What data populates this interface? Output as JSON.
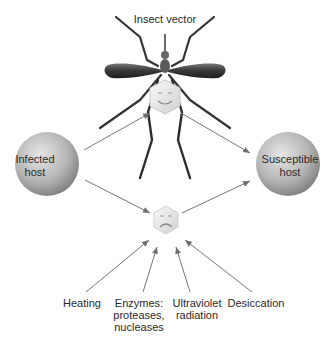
{
  "diagram": {
    "title": "Insect vector",
    "nodes": {
      "infected_host": {
        "line1": "Infected",
        "line2": "host"
      },
      "susceptible_host": {
        "line1": "Susceptible",
        "line2": "host"
      },
      "virus_in_vector": {
        "expression": "smiling"
      },
      "virus_in_environment": {
        "expression": "frowning"
      }
    },
    "factors": [
      {
        "line1": "Heating",
        "line2": "",
        "line3": ""
      },
      {
        "line1": "Enzymes:",
        "line2": "proteases,",
        "line3": "nucleases"
      },
      {
        "line1": "Ultraviolet",
        "line2": "radiation",
        "line3": ""
      },
      {
        "line1": "Desiccation",
        "line2": "",
        "line3": ""
      }
    ],
    "edges": [
      "infected_host -> insect_vector",
      "insect_vector -> susceptible_host",
      "infected_host -> virus_in_environment",
      "virus_in_environment -> susceptible_host",
      "Heating -> virus_in_environment",
      "Enzymes -> virus_in_environment",
      "Ultraviolet radiation -> virus_in_environment",
      "Desiccation -> virus_in_environment"
    ],
    "colors": {
      "sphere_light": "#d8d8d8",
      "sphere_dark": "#8a8a8a",
      "mosquito_dark": "#3a3a3a",
      "arrow": "#777777"
    }
  }
}
